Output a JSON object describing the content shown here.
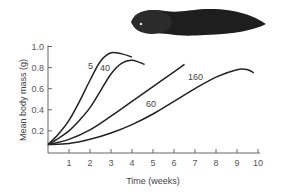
{
  "chart_data": {
    "type": "line",
    "title": "",
    "xlabel": "Time (weeks)",
    "ylabel": "Mean body mass (g)",
    "xlim": [
      0,
      10
    ],
    "ylim": [
      0,
      1.0
    ],
    "x_ticks": [
      "1",
      "2",
      "3",
      "4",
      "5",
      "6",
      "7",
      "8",
      "9",
      "10"
    ],
    "y_ticks": [
      "0.2",
      "0.4",
      "0.6",
      "0.8",
      "1.0"
    ],
    "grid": false,
    "legend": "inline curve labels",
    "series": [
      {
        "name": "5",
        "points": [
          [
            0,
            0.07
          ],
          [
            0.5,
            0.17
          ],
          [
            1,
            0.3
          ],
          [
            1.5,
            0.48
          ],
          [
            2,
            0.68
          ],
          [
            2.5,
            0.86
          ],
          [
            3,
            0.94
          ],
          [
            3.5,
            0.93
          ],
          [
            4,
            0.9
          ]
        ]
      },
      {
        "name": "40",
        "points": [
          [
            0,
            0.07
          ],
          [
            0.5,
            0.13
          ],
          [
            1,
            0.2
          ],
          [
            1.5,
            0.3
          ],
          [
            2,
            0.42
          ],
          [
            2.5,
            0.58
          ],
          [
            3,
            0.74
          ],
          [
            3.5,
            0.84
          ],
          [
            4,
            0.87
          ],
          [
            4.6,
            0.83
          ]
        ]
      },
      {
        "name": "60",
        "points": [
          [
            0,
            0.07
          ],
          [
            1,
            0.12
          ],
          [
            2,
            0.21
          ],
          [
            3,
            0.34
          ],
          [
            4,
            0.48
          ],
          [
            5,
            0.62
          ],
          [
            6,
            0.76
          ],
          [
            6.5,
            0.83
          ]
        ]
      },
      {
        "name": "160",
        "points": [
          [
            0,
            0.07
          ],
          [
            1,
            0.08
          ],
          [
            2,
            0.12
          ],
          [
            3,
            0.18
          ],
          [
            4,
            0.26
          ],
          [
            5,
            0.36
          ],
          [
            6,
            0.48
          ],
          [
            7,
            0.6
          ],
          [
            8,
            0.71
          ],
          [
            9,
            0.78
          ],
          [
            9.5,
            0.78
          ],
          [
            9.8,
            0.75
          ]
        ]
      }
    ],
    "annotations": [
      "tadpole illustration top-right"
    ]
  },
  "labels": {
    "xlabel": "Time (weeks)",
    "ylabel": "Mean body mass (g)"
  }
}
